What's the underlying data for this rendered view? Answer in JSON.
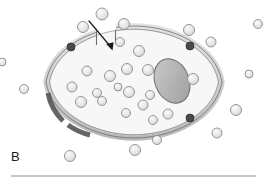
{
  "figure": {
    "panel_label": "B",
    "caption_rule": true,
    "background_color": "#ffffff"
  },
  "colors": {
    "membrane_fill": "#d2d2d2",
    "membrane_stroke": "#6f6f6f",
    "membrane_dark_segment": "#585858",
    "membrane_node": "#4a4a4a",
    "cytoplasm_fill": "#f7f7f7",
    "cytoplasm_stroke": "#8a8a8a",
    "nucleus_fill": "#b0b0b0",
    "nucleus_stroke": "#6a6a6a",
    "particle_fill": "#e3e3e3",
    "particle_stroke": "#8c8c8c",
    "arrow_color": "#1a1a1a",
    "rule_color": "#8d8d8d",
    "label_color": "#1b1b1b"
  },
  "cell": {
    "name": "lens-shaped cell with breached membrane",
    "center_x": 134,
    "center_y": 80,
    "width": 180,
    "height": 86,
    "membrane_thickness": 5,
    "outline_path": "M 46 82 C 52 46 96 26 134 26 C 172 26 216 46 222 82 C 216 118 172 138 134 138 C 96 138 52 118 46 82 Z",
    "membrane_gap": {
      "present": true,
      "label": "membrane pore / breach",
      "start_x": 96,
      "end_x": 116,
      "y": 31
    }
  },
  "nucleus": {
    "name": "nucleus",
    "cx": 172,
    "cy": 81,
    "rx": 17,
    "ry": 23,
    "rotation": -22
  },
  "arrow": {
    "name": "influx arrow",
    "x1": 89,
    "y1": 21,
    "x2": 112,
    "y2": 49,
    "head_size": 7
  },
  "membrane_nodes": [
    {
      "id": "node-upper-left",
      "cx": 71,
      "cy": 47,
      "r": 4.0
    },
    {
      "id": "node-upper-right",
      "cx": 190,
      "cy": 46,
      "r": 4.0
    },
    {
      "id": "node-lower-right",
      "cx": 190,
      "cy": 118,
      "r": 4.0
    }
  ],
  "membrane_dark_segments": [
    {
      "id": "segment-lower-left",
      "path": "M 48 93 C 50 104 55 113 63 121",
      "width": 5
    },
    {
      "id": "segment-bottom-left",
      "path": "M 68 125 C 75 130 82 133 90 135",
      "width": 5
    }
  ],
  "particles": {
    "name": "granules / vesicles",
    "interior_count": 18,
    "exterior_count": 14,
    "radius_range": [
      4,
      6
    ],
    "interior": [
      {
        "cx": 87,
        "cy": 71,
        "r": 5.0
      },
      {
        "cx": 72,
        "cy": 87,
        "r": 5.0
      },
      {
        "cx": 110,
        "cy": 76,
        "r": 5.5
      },
      {
        "cx": 97,
        "cy": 93,
        "r": 4.5
      },
      {
        "cx": 81,
        "cy": 102,
        "r": 5.5
      },
      {
        "cx": 102,
        "cy": 101,
        "r": 4.5
      },
      {
        "cx": 127,
        "cy": 69,
        "r": 5.5
      },
      {
        "cx": 139,
        "cy": 51,
        "r": 5.5
      },
      {
        "cx": 120,
        "cy": 42,
        "r": 4.5
      },
      {
        "cx": 118,
        "cy": 87,
        "r": 4.0
      },
      {
        "cx": 129,
        "cy": 92,
        "r": 5.5
      },
      {
        "cx": 148,
        "cy": 70,
        "r": 5.5
      },
      {
        "cx": 143,
        "cy": 105,
        "r": 5.0
      },
      {
        "cx": 126,
        "cy": 113,
        "r": 4.5
      },
      {
        "cx": 153,
        "cy": 120,
        "r": 4.5
      },
      {
        "cx": 168,
        "cy": 114,
        "r": 5.0
      },
      {
        "cx": 150,
        "cy": 95,
        "r": 4.5
      },
      {
        "cx": 193,
        "cy": 79,
        "r": 5.5
      }
    ],
    "exterior": [
      {
        "cx": 83,
        "cy": 27,
        "r": 5.5
      },
      {
        "cx": 102,
        "cy": 14,
        "r": 6.0
      },
      {
        "cx": 124,
        "cy": 24,
        "r": 5.5
      },
      {
        "cx": 24,
        "cy": 89,
        "r": 4.5
      },
      {
        "cx": 189,
        "cy": 30,
        "r": 5.5
      },
      {
        "cx": 211,
        "cy": 42,
        "r": 5.0
      },
      {
        "cx": 236,
        "cy": 110,
        "r": 5.5
      },
      {
        "cx": 217,
        "cy": 133,
        "r": 5.0
      },
      {
        "cx": 135,
        "cy": 150,
        "r": 5.5
      },
      {
        "cx": 70,
        "cy": 156,
        "r": 5.5
      },
      {
        "cx": 157,
        "cy": 140,
        "r": 4.5
      },
      {
        "cx": 249,
        "cy": 74,
        "r": 4.0
      },
      {
        "cx": 2,
        "cy": 62,
        "r": 4.0
      },
      {
        "cx": 258,
        "cy": 24,
        "r": 4.5
      }
    ]
  },
  "caption_rule": {
    "x1": 11,
    "x2": 256,
    "y": 176
  }
}
